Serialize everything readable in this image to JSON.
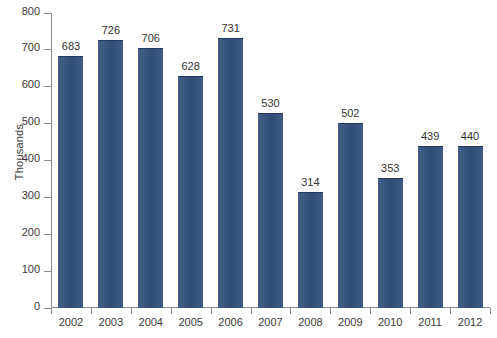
{
  "chart_data": {
    "type": "bar",
    "title": "",
    "subtitle": "",
    "xlabel": "",
    "ylabel": "Thousands",
    "categories": [
      "2002",
      "2003",
      "2004",
      "2005",
      "2006",
      "2007",
      "2008",
      "2009",
      "2010",
      "2011",
      "2012"
    ],
    "values": [
      683,
      726,
      706,
      628,
      731,
      530,
      314,
      502,
      353,
      439,
      440
    ],
    "value_labels": [
      "683",
      "726",
      "706",
      "628",
      "731",
      "530",
      "314",
      "502",
      "353",
      "439",
      "440"
    ],
    "ylim": [
      0,
      800
    ],
    "ytick_labels": [
      "0",
      "100",
      "200",
      "300",
      "400",
      "500",
      "600",
      "700",
      "800"
    ],
    "ytick_values": [
      0,
      100,
      200,
      300,
      400,
      500,
      600,
      700,
      800
    ],
    "grid": false,
    "legend": null,
    "legend_position": "none",
    "bar_color": "#34527e",
    "axis_color": "#8a8a8a",
    "text_color": "#3a3a3a",
    "background_color": "#ffffff"
  }
}
